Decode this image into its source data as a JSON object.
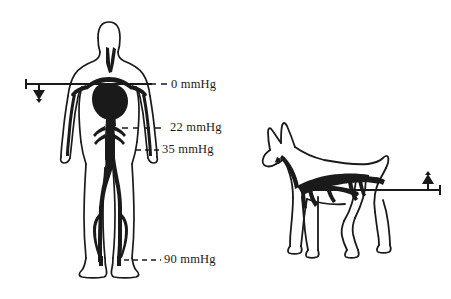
{
  "figure": {
    "background_color": "#ffffff",
    "ink_color": "#1a1a1a",
    "vessel_fill_color": "#1a1a1a",
    "outline_color": "#1a1a1a",
    "units": "mmHg"
  },
  "labels": [
    {
      "id": "level-0",
      "value": "0",
      "text": "0 mmHg",
      "anatomical_site": "heart / aortic arch level"
    },
    {
      "id": "level-22",
      "value": "22",
      "text": "22 mmHg",
      "anatomical_site": "lower abdomen / pelvis level"
    },
    {
      "id": "level-35",
      "value": "35",
      "text": "35 mmHg",
      "anatomical_site": "hand / wrist level"
    },
    {
      "id": "level-90",
      "value": "90",
      "text": "90 mmHg",
      "anatomical_site": "ankle / foot level"
    }
  ],
  "reference_lines": [
    {
      "id": "human-reference-line",
      "subject": "human",
      "marker": "down-pointer-icon",
      "marker_direction": "down",
      "aligned_level": "0 mmHg"
    },
    {
      "id": "dog-reference-line",
      "subject": "dog",
      "marker": "up-pointer-icon",
      "marker_direction": "up",
      "aligned_level": "heart level"
    }
  ],
  "subjects": [
    {
      "id": "human-figure",
      "name": "human-figure",
      "posture": "upright standing",
      "shows": "arterial vascular tree"
    },
    {
      "id": "dog-figure",
      "name": "dog-figure",
      "posture": "quadruped standing",
      "shows": "arterial vascular tree"
    }
  ],
  "dash_connectors": [
    {
      "id": "dash-0",
      "level": "0 mmHg"
    },
    {
      "id": "dash-22",
      "level": "22 mmHg"
    },
    {
      "id": "dash-35",
      "level": "35 mmHg"
    },
    {
      "id": "dash-90",
      "level": "90 mmHg"
    }
  ]
}
